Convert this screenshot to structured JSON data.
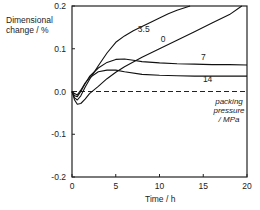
{
  "chart_data": {
    "type": "line",
    "title": "",
    "xlabel": "Time / h",
    "ylabel": "Dimensional change / %",
    "ylabel_lines": [
      "Dimensional",
      "change / %"
    ],
    "xlim": [
      0,
      20
    ],
    "ylim": [
      -0.2,
      0.2
    ],
    "xticks": [
      0,
      5,
      10,
      15,
      20
    ],
    "xtick_labels": [
      "0",
      "5",
      "10",
      "15",
      "20"
    ],
    "yticks": [
      0.2,
      0.1,
      0.0,
      -0.1,
      -0.2
    ],
    "ytick_labels": [
      "0.2",
      "0.1",
      "0.0",
      "-0.1",
      "-0.2"
    ],
    "grid": false,
    "legend": null,
    "annotation": {
      "lines": [
        "packing",
        "pressure",
        "/ MPa"
      ],
      "note": "Curve labels denote packing pressure in MPa"
    },
    "reference_line": {
      "y": 0.0,
      "style": "dashed"
    },
    "series": [
      {
        "name": "0",
        "label_pos": [
          10.4,
          0.115
        ],
        "x": [
          0,
          0.3,
          0.6,
          1.0,
          1.5,
          2.0,
          3.0,
          4.0,
          5.0,
          6.0,
          8.0,
          10.0,
          12.0,
          14.0,
          16.0,
          18.0,
          19.4
        ],
        "y": [
          0.0,
          -0.02,
          -0.03,
          -0.028,
          -0.018,
          -0.005,
          0.012,
          0.03,
          0.045,
          0.058,
          0.08,
          0.1,
          0.12,
          0.14,
          0.16,
          0.18,
          0.2
        ]
      },
      {
        "name": "3.5",
        "label_pos": [
          8.2,
          0.14
        ],
        "x": [
          0,
          0.3,
          0.6,
          1.0,
          1.5,
          2.0,
          3.0,
          4.0,
          5.0,
          6.0,
          7.0,
          8.0,
          9.0,
          10.0,
          11.0,
          12.0,
          13.5
        ],
        "y": [
          0.0,
          -0.015,
          -0.02,
          -0.01,
          0.01,
          0.028,
          0.06,
          0.09,
          0.115,
          0.13,
          0.142,
          0.152,
          0.162,
          0.172,
          0.182,
          0.19,
          0.2
        ]
      },
      {
        "name": "7",
        "label_pos": [
          15.0,
          0.074
        ],
        "x": [
          0,
          0.3,
          0.6,
          1.0,
          1.5,
          2.0,
          3.0,
          4.0,
          5.0,
          6.0,
          7.0,
          8.0,
          10.0,
          12.0,
          14.0,
          16.0,
          18.0,
          20.0
        ],
        "y": [
          0.0,
          -0.01,
          -0.012,
          0.0,
          0.018,
          0.035,
          0.055,
          0.068,
          0.075,
          0.076,
          0.073,
          0.07,
          0.067,
          0.065,
          0.064,
          0.063,
          0.063,
          0.062
        ]
      },
      {
        "name": "14",
        "label_pos": [
          15.5,
          0.023
        ],
        "x": [
          0,
          0.3,
          0.6,
          1.0,
          1.5,
          2.0,
          3.0,
          4.0,
          5.0,
          6.0,
          8.0,
          10.0,
          12.0,
          14.0,
          16.0,
          18.0,
          20.0
        ],
        "y": [
          0.0,
          -0.005,
          -0.008,
          0.003,
          0.02,
          0.032,
          0.046,
          0.05,
          0.05,
          0.046,
          0.04,
          0.038,
          0.037,
          0.036,
          0.036,
          0.036,
          0.036
        ]
      }
    ]
  },
  "layout": {
    "plot": {
      "left": 72,
      "right": 247,
      "top": 6,
      "bottom": 177
    }
  }
}
